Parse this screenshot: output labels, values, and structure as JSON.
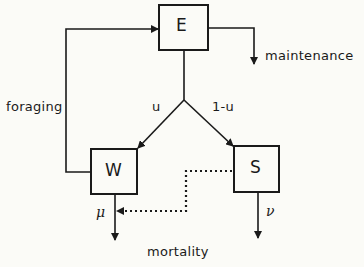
{
  "nodes": {
    "E": {
      "label": "E"
    },
    "W": {
      "label": "W"
    },
    "S": {
      "label": "S"
    }
  },
  "edges": {
    "foraging": "foraging",
    "maintenance": "maintenance",
    "u": "u",
    "one_minus_u": "1-u",
    "mu": "μ",
    "nu": "ν",
    "mortality": "mortality"
  },
  "colors": {
    "line": "#1a1a1a",
    "background": "#fbfbf7"
  }
}
